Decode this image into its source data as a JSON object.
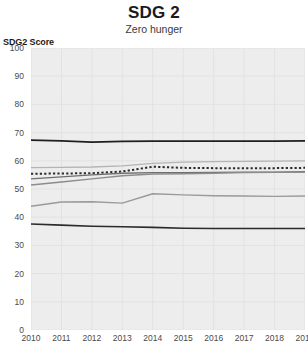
{
  "header": {
    "title": "SDG 2",
    "subtitle": "Zero hunger"
  },
  "axes": {
    "y_title": "SDG2 Score",
    "y_ticks": [
      "100",
      "90",
      "80",
      "70",
      "60",
      "50",
      "40",
      "30",
      "20",
      "10",
      "0"
    ],
    "x_ticks": [
      "2010",
      "2011",
      "2012",
      "2013",
      "2014",
      "2015",
      "2016",
      "2017",
      "2018",
      "2019"
    ]
  },
  "chart_data": {
    "type": "line",
    "title": "SDG 2",
    "subtitle": "Zero hunger",
    "xlabel": "",
    "ylabel": "SDG2 Score",
    "x": [
      2010,
      2011,
      2012,
      2013,
      2014,
      2015,
      2016,
      2017,
      2018,
      2019
    ],
    "ylim": [
      0,
      100
    ],
    "xlim": [
      2010,
      2019
    ],
    "ytick_step": 10,
    "grid": true,
    "legend": "none",
    "plot_background": "#ededed",
    "gridline_color": "#e2e2e2",
    "series": [
      {
        "name": "series-top-dark",
        "color": "#1f1f1f",
        "width": 1.8,
        "style": "solid",
        "values": [
          67.3,
          67.1,
          66.6,
          66.9,
          67.0,
          67.0,
          67.0,
          67.0,
          67.0,
          67.1
        ]
      },
      {
        "name": "series-upper-light-gray",
        "color": "#b4b4b4",
        "width": 1.3,
        "style": "solid",
        "values": [
          57.6,
          57.7,
          57.8,
          58.2,
          59.1,
          59.5,
          59.7,
          59.8,
          59.9,
          60.0
        ]
      },
      {
        "name": "series-dotted",
        "color": "#2b2b2b",
        "width": 2.0,
        "style": "dotted",
        "values": [
          55.4,
          55.5,
          55.6,
          56.2,
          57.9,
          57.5,
          57.4,
          57.4,
          57.4,
          57.5
        ]
      },
      {
        "name": "series-mid-dark-gray",
        "color": "#6e6e6e",
        "width": 1.4,
        "style": "solid",
        "values": [
          53.6,
          54.3,
          55.0,
          55.6,
          55.8,
          55.8,
          55.9,
          56.0,
          56.0,
          56.1
        ]
      },
      {
        "name": "series-rising-gray",
        "color": "#8c8c8c",
        "width": 1.4,
        "style": "solid",
        "values": [
          51.4,
          52.5,
          53.6,
          54.7,
          55.3,
          55.4,
          55.6,
          55.8,
          55.9,
          56.0
        ]
      },
      {
        "name": "series-lower-gray",
        "color": "#9a9a9a",
        "width": 1.4,
        "style": "solid",
        "values": [
          43.9,
          45.4,
          45.5,
          45.0,
          48.3,
          47.9,
          47.6,
          47.5,
          47.4,
          47.5
        ]
      },
      {
        "name": "series-bottom-dark",
        "color": "#2b2b2b",
        "width": 1.6,
        "style": "solid",
        "values": [
          37.6,
          37.2,
          36.8,
          36.6,
          36.4,
          36.1,
          36.0,
          36.0,
          36.0,
          36.0
        ]
      }
    ]
  }
}
